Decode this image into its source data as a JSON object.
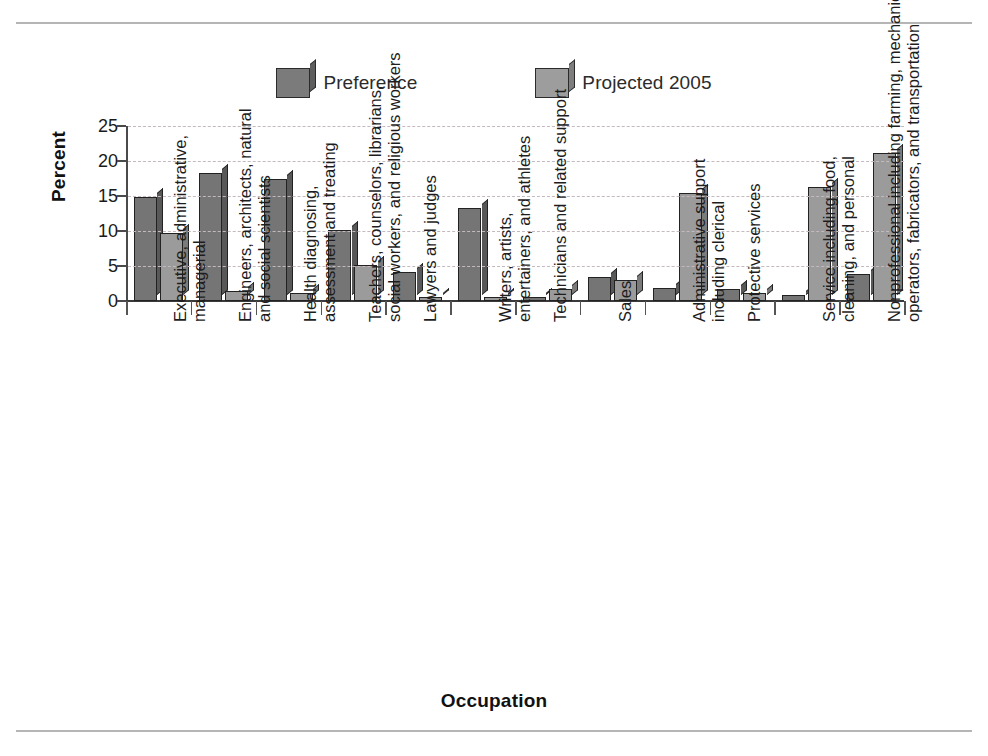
{
  "chart_data": {
    "type": "bar",
    "title": "",
    "xlabel": "Occupation",
    "ylabel": "Percent",
    "ylim": [
      0,
      25
    ],
    "yticks": [
      0,
      5,
      10,
      15,
      20,
      25
    ],
    "grid": true,
    "legend_position": "top-center",
    "categories": [
      "Executive, administrative, managerial",
      "Engineers, architects, natural and social scientists",
      "Health diagnosing, assessment and treating",
      "Teachers, counselors, librarians, social workers, and religious workers",
      "Lawyers and judges",
      "Writers, artists, entertainers, and athletes",
      "Technicians and related support",
      "Sales",
      "Administrative support including clerical",
      "Protective services",
      "Service including food, cleaning, and personal",
      "Nonprofessional including farming, mechanics, operators, fabricators, and transportation"
    ],
    "category_lines": [
      [
        "Executive, administrative,",
        "managerial"
      ],
      [
        "Engineers, architects, natural",
        "and social scientists"
      ],
      [
        "Health diagnosing,",
        "assessment and treating"
      ],
      [
        "Teachers, counselors, librarians,",
        "social workers, and religious workers"
      ],
      [
        "Lawyers and judges"
      ],
      [
        "Writers, artists,",
        "entertainers, and athletes"
      ],
      [
        "Technicians and related support"
      ],
      [
        "Sales"
      ],
      [
        "Administrative support",
        "including clerical"
      ],
      [
        "Protective services"
      ],
      [
        "Service including food,",
        "cleaning, and personal"
      ],
      [
        "Nonprofessional including farming, mechanics,",
        "operators, fabricators, and transportation"
      ]
    ],
    "series": [
      {
        "name": "Preference",
        "color": "#757575",
        "values": [
          14.8,
          18.3,
          17.4,
          10.1,
          4.1,
          13.3,
          0.5,
          3.4,
          1.8,
          1.7,
          0.9,
          3.9
        ]
      },
      {
        "name": "Projected 2005",
        "color": "#9b9b9b",
        "values": [
          9.7,
          1.4,
          1.2,
          5.2,
          0.4,
          0.3,
          1.7,
          3.0,
          15.4,
          1.1,
          16.3,
          21.2
        ]
      }
    ]
  },
  "legend": {
    "entries": [
      {
        "label": "Preference"
      },
      {
        "label": "Projected 2005"
      }
    ]
  },
  "axes": {
    "y_title": "Percent",
    "x_title": "Occupation",
    "y_tick_labels": [
      "0",
      "5",
      "10",
      "15",
      "20",
      "25"
    ]
  }
}
